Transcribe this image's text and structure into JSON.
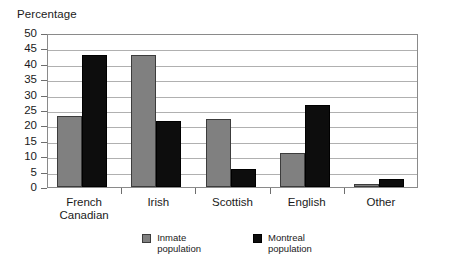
{
  "chart_data": {
    "type": "bar",
    "title": "",
    "ylabel": "Percentage",
    "xlabel": "",
    "categories": [
      "French\nCanadian",
      "Irish",
      "Scottish",
      "English",
      "Other"
    ],
    "series": [
      {
        "name": "Inmate\npopulation",
        "color": "#808080",
        "values": [
          23,
          43,
          22,
          11,
          1
        ]
      },
      {
        "name": "Montreal\npopulation",
        "color": "#000000",
        "values": [
          43,
          21.5,
          6,
          26.5,
          2.5
        ]
      }
    ],
    "ylim": [
      0,
      50
    ],
    "ytick_step": 5,
    "yticks": [
      "50",
      "45",
      "40",
      "35",
      "30",
      "25",
      "20",
      "15",
      "10",
      "5",
      "0"
    ],
    "grid": "horizontal",
    "legend_position": "bottom-center"
  },
  "axis": {
    "y_title": "Percentage"
  },
  "legend": {
    "items": [
      {
        "label": "Inmate\npopulation",
        "swatch": "gray-swatch-icon"
      },
      {
        "label": "Montreal\npopulation",
        "swatch": "black-swatch-icon"
      }
    ]
  }
}
